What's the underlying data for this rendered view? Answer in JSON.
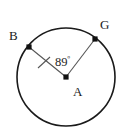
{
  "figure": {
    "type": "circle-central-angle",
    "background_color": "#ffffff",
    "stroke_color": "#1a1a1a",
    "radius_line_color": "#555555",
    "circle": {
      "center_x": 66,
      "center_y": 77,
      "radius": 49,
      "stroke_width": 1.5
    },
    "center_point": {
      "label": "A",
      "x": 66,
      "y": 77,
      "label_x": 73,
      "label_y": 96
    },
    "points": [
      {
        "label": "B",
        "x": 29,
        "y": 47,
        "label_x": 9,
        "label_y": 40
      },
      {
        "label": "G",
        "x": 95,
        "y": 39,
        "label_x": 100,
        "label_y": 29
      }
    ],
    "angle": {
      "value": "89",
      "degree_symbol": "º",
      "full_label": "89º",
      "label_x": 55,
      "label_y": 66,
      "vertex": "A",
      "rays": [
        "B",
        "G"
      ]
    },
    "tick_mark": {
      "on_segment": "AB",
      "x": 44,
      "y": 63
    }
  }
}
